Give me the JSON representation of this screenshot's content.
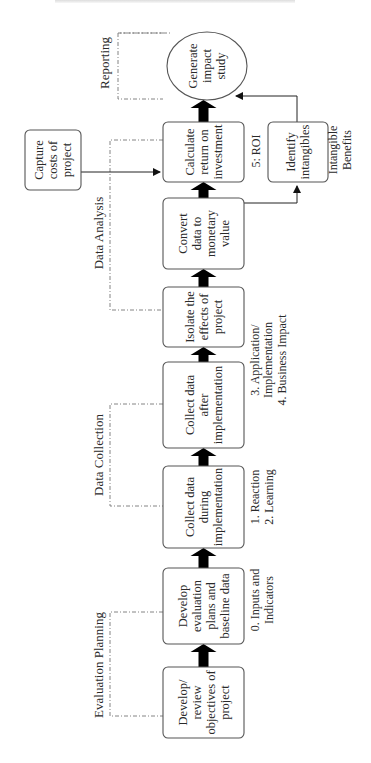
{
  "diagram": {
    "header_clipped": true,
    "phases": [
      {
        "id": "planning",
        "label": "Evaluation Planning"
      },
      {
        "id": "collection",
        "label": "Data Collection"
      },
      {
        "id": "analysis",
        "label": "Data Analysis"
      },
      {
        "id": "reporting",
        "label": "Reporting"
      }
    ],
    "steps": [
      {
        "id": "objectives",
        "lines": [
          "Develop/",
          "review",
          "objectives of",
          "project"
        ]
      },
      {
        "id": "plans",
        "lines": [
          "Develop",
          "evaluation",
          "plans and",
          "baseline data"
        ]
      },
      {
        "id": "collect-during",
        "lines": [
          "Collect data",
          "during",
          "implementation"
        ]
      },
      {
        "id": "collect-after",
        "lines": [
          "Collect data",
          "after",
          "implementation"
        ]
      },
      {
        "id": "isolate",
        "lines": [
          "Isolate the",
          "effects of",
          "project"
        ]
      },
      {
        "id": "convert",
        "lines": [
          "Convert",
          "data to",
          "monetary",
          "value"
        ]
      },
      {
        "id": "roi",
        "lines": [
          "Calculate",
          "return on",
          "investment"
        ]
      },
      {
        "id": "report",
        "lines": [
          "Generate",
          "impact",
          "study"
        ]
      }
    ],
    "side_boxes": {
      "costs": {
        "lines": [
          "Capture",
          "costs of",
          "project"
        ]
      },
      "intangibles": {
        "lines": [
          "Identify",
          "intangibles"
        ]
      }
    },
    "level_labels": {
      "inputs": [
        "0. Inputs and",
        "Indicators"
      ],
      "reaction": [
        "1. Reaction",
        "2. Learning"
      ],
      "application": [
        "3. Application/",
        "Implementation",
        "4. Business Impact"
      ],
      "roi": [
        "5: ROI"
      ],
      "intangible": [
        "Intangible",
        "Benefits"
      ]
    }
  }
}
